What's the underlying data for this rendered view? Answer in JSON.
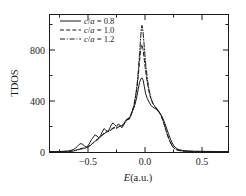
{
  "chart_data": {
    "type": "line",
    "title": "",
    "xlabel": "E(a.u.)",
    "ylabel": "TDOS",
    "xlim": [
      -0.78,
      0.73
    ],
    "ylim": [
      0,
      1010
    ],
    "grid": false,
    "legend_position": "top-left",
    "xticks": [
      -0.5,
      0.0,
      0.5
    ],
    "xtick_labels": [
      "−0.5",
      "0.0",
      "0.5"
    ],
    "yticks": [
      0,
      400,
      800
    ],
    "ytick_labels": [
      "0",
      "400",
      "800"
    ],
    "xminor_ticks": [
      -0.25,
      0.25
    ],
    "yminor_ticks": [
      200,
      600,
      1000
    ],
    "series": [
      {
        "name": "c/a = 0.8",
        "style": "solid",
        "color": "#1a1a1a",
        "x": [
          -0.78,
          -0.74,
          -0.7,
          -0.66,
          -0.62,
          -0.6,
          -0.58,
          -0.56,
          -0.545,
          -0.53,
          -0.515,
          -0.5,
          -0.485,
          -0.47,
          -0.455,
          -0.44,
          -0.425,
          -0.41,
          -0.395,
          -0.38,
          -0.365,
          -0.35,
          -0.335,
          -0.32,
          -0.305,
          -0.29,
          -0.275,
          -0.26,
          -0.245,
          -0.23,
          -0.215,
          -0.2,
          -0.185,
          -0.17,
          -0.155,
          -0.14,
          -0.125,
          -0.11,
          -0.095,
          -0.08,
          -0.065,
          -0.05,
          -0.04,
          -0.03,
          -0.02,
          -0.01,
          0.0,
          0.01,
          0.02,
          0.03,
          0.045,
          0.06,
          0.075,
          0.09,
          0.105,
          0.12,
          0.135,
          0.15,
          0.165,
          0.18,
          0.195,
          0.21,
          0.225,
          0.24,
          0.255,
          0.27,
          0.29,
          0.31,
          0.34,
          0.38,
          0.43,
          0.5,
          0.58,
          0.66,
          0.73
        ],
        "y": [
          3,
          3,
          4,
          5,
          8,
          12,
          18,
          28,
          42,
          55,
          62,
          56,
          44,
          36,
          46,
          68,
          92,
          110,
          126,
          118,
          104,
          120,
          148,
          172,
          160,
          150,
          168,
          196,
          214,
          200,
          188,
          206,
          196,
          178,
          196,
          230,
          244,
          238,
          262,
          300,
          330,
          380,
          420,
          470,
          512,
          536,
          545,
          528,
          480,
          432,
          392,
          366,
          344,
          330,
          322,
          316,
          300,
          286,
          268,
          240,
          206,
          168,
          130,
          96,
          66,
          44,
          28,
          18,
          12,
          8,
          6,
          5,
          4,
          3,
          3
        ]
      },
      {
        "name": "c/a = 1.0",
        "style": "dashed",
        "color": "#1a1a1a",
        "x": [
          -0.78,
          -0.74,
          -0.7,
          -0.66,
          -0.62,
          -0.6,
          -0.58,
          -0.56,
          -0.545,
          -0.53,
          -0.515,
          -0.5,
          -0.485,
          -0.47,
          -0.455,
          -0.44,
          -0.425,
          -0.41,
          -0.395,
          -0.38,
          -0.365,
          -0.35,
          -0.335,
          -0.32,
          -0.305,
          -0.29,
          -0.275,
          -0.26,
          -0.245,
          -0.23,
          -0.215,
          -0.2,
          -0.185,
          -0.17,
          -0.155,
          -0.14,
          -0.125,
          -0.11,
          -0.095,
          -0.08,
          -0.065,
          -0.05,
          -0.04,
          -0.03,
          -0.02,
          -0.012,
          -0.005,
          0.0,
          0.008,
          0.018,
          0.03,
          0.045,
          0.06,
          0.075,
          0.09,
          0.105,
          0.12,
          0.135,
          0.15,
          0.165,
          0.18,
          0.195,
          0.21,
          0.225,
          0.24,
          0.255,
          0.27,
          0.29,
          0.31,
          0.34,
          0.38,
          0.43,
          0.5,
          0.58,
          0.66,
          0.73
        ],
        "y": [
          2,
          2,
          3,
          4,
          5,
          6,
          8,
          12,
          18,
          22,
          26,
          28,
          30,
          34,
          40,
          48,
          58,
          70,
          82,
          92,
          100,
          112,
          126,
          138,
          146,
          152,
          158,
          166,
          176,
          182,
          178,
          184,
          192,
          196,
          204,
          222,
          238,
          250,
          272,
          306,
          352,
          424,
          486,
          570,
          670,
          740,
          782,
          790,
          760,
          690,
          600,
          510,
          440,
          392,
          358,
          338,
          322,
          306,
          286,
          258,
          222,
          180,
          138,
          100,
          68,
          44,
          28,
          17,
          11,
          7,
          5,
          4,
          3,
          2,
          2,
          2
        ]
      },
      {
        "name": "c/a = 1.2",
        "style": "dashdot",
        "color": "#1a1a1a",
        "x": [
          -0.78,
          -0.74,
          -0.7,
          -0.66,
          -0.62,
          -0.6,
          -0.58,
          -0.56,
          -0.545,
          -0.53,
          -0.515,
          -0.5,
          -0.485,
          -0.47,
          -0.455,
          -0.44,
          -0.425,
          -0.41,
          -0.395,
          -0.38,
          -0.365,
          -0.35,
          -0.335,
          -0.32,
          -0.305,
          -0.29,
          -0.275,
          -0.26,
          -0.245,
          -0.23,
          -0.215,
          -0.2,
          -0.185,
          -0.17,
          -0.155,
          -0.14,
          -0.125,
          -0.11,
          -0.095,
          -0.08,
          -0.065,
          -0.05,
          -0.04,
          -0.03,
          -0.02,
          -0.012,
          -0.005,
          0.0,
          0.008,
          0.018,
          0.03,
          0.045,
          0.06,
          0.075,
          0.09,
          0.105,
          0.12,
          0.135,
          0.15,
          0.165,
          0.18,
          0.195,
          0.21,
          0.225,
          0.24,
          0.255,
          0.27,
          0.29,
          0.31,
          0.34,
          0.38,
          0.43,
          0.5,
          0.58,
          0.66,
          0.73
        ],
        "y": [
          2,
          2,
          3,
          3,
          4,
          5,
          7,
          10,
          14,
          18,
          22,
          24,
          27,
          31,
          37,
          45,
          55,
          66,
          78,
          88,
          96,
          108,
          122,
          134,
          142,
          148,
          154,
          162,
          172,
          178,
          174,
          180,
          190,
          194,
          202,
          220,
          236,
          248,
          270,
          304,
          354,
          436,
          506,
          606,
          730,
          830,
          905,
          930,
          890,
          790,
          660,
          540,
          456,
          400,
          362,
          340,
          324,
          308,
          288,
          260,
          224,
          182,
          140,
          102,
          70,
          46,
          29,
          18,
          12,
          8,
          5,
          4,
          3,
          2,
          2,
          2
        ]
      }
    ]
  },
  "legend": {
    "entries": [
      {
        "label_prefix": "c",
        "label_sep": "/",
        "label_mid": "a",
        "label_suffix": " = 0.8",
        "full": "c/a = 0.8"
      },
      {
        "label_prefix": "c",
        "label_sep": "/",
        "label_mid": "a",
        "label_suffix": " = 1.0",
        "full": "c/a = 1.0"
      },
      {
        "label_prefix": "c",
        "label_sep": "/",
        "label_mid": "a",
        "label_suffix": " = 1.2",
        "full": "c/a = 1.2"
      }
    ]
  },
  "axes": {
    "y_title": "TDOS",
    "x_title_italic": "E",
    "x_title_rest": "(a.u.)",
    "x_title_full": "E(a.u.)"
  }
}
